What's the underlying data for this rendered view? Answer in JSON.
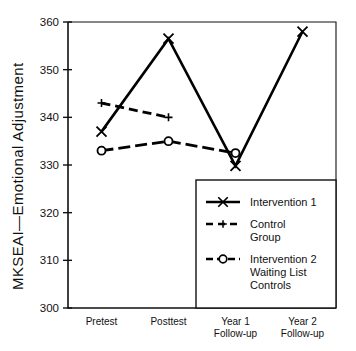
{
  "chart_data": {
    "type": "line",
    "title": "",
    "xlabel": "",
    "ylabel": "MKSEAI—Emotional Adjustment",
    "categories": [
      "Pretest",
      "Posttest",
      "Year 1 Follow-up",
      "Year 2 Follow-up"
    ],
    "category_lines": [
      [
        "Pretest"
      ],
      [
        "Posttest"
      ],
      [
        "Year 1",
        "Follow-up"
      ],
      [
        "Year 2",
        "Follow-up"
      ]
    ],
    "ylim": [
      300,
      360
    ],
    "yticks": [
      300,
      310,
      320,
      330,
      340,
      350,
      360
    ],
    "ytick_labels": [
      "300",
      "310",
      "320",
      "330",
      "340",
      "350",
      "360"
    ],
    "grid": false,
    "legend_position": "lower right",
    "series": [
      {
        "name": "Intervention 1",
        "legend_lines": [
          "Intervention 1"
        ],
        "linestyle": "solid",
        "marker": "x",
        "color": "#000000",
        "x": [
          "Pretest",
          "Posttest",
          "Year 1 Follow-up",
          "Year 2 Follow-up"
        ],
        "values": [
          337,
          356.5,
          329.8,
          358
        ]
      },
      {
        "name": "Control Group",
        "legend_lines": [
          "Control",
          "Group"
        ],
        "linestyle": "dashed",
        "marker": "plus",
        "color": "#000000",
        "x": [
          "Pretest",
          "Posttest"
        ],
        "values": [
          343,
          340
        ]
      },
      {
        "name": "Intervention 2 Waiting List Controls",
        "legend_lines": [
          "Intervention 2",
          "Waiting List",
          "Controls"
        ],
        "linestyle": "dashdot",
        "marker": "circle",
        "color": "#000000",
        "x": [
          "Pretest",
          "Posttest",
          "Year 1 Follow-up"
        ],
        "values": [
          333,
          335,
          332.5
        ]
      }
    ]
  }
}
